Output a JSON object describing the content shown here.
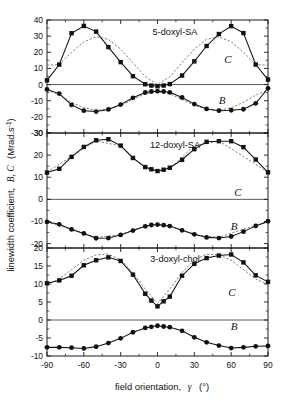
{
  "figure": {
    "y_axis_title_main": "linewidth coefficient,",
    "y_axis_title_symbols": "B, C",
    "y_axis_title_units": "(Mrad.s",
    "y_axis_title_units_sup": "-1",
    "y_axis_title_units_close": ")",
    "x_axis_title_main": "field orientation,",
    "x_axis_title_symbol": "γ",
    "x_axis_title_units": "(°)",
    "x_ticks": [
      "-90",
      "-60",
      "-30",
      "0",
      "30",
      "60",
      "90"
    ],
    "x_tick_values": [
      -90,
      -60,
      -30,
      0,
      30,
      60,
      90
    ],
    "xlim": [
      -90,
      90
    ],
    "colors": {
      "data": "#111111",
      "fit": "#777777",
      "frame": "#1a1a1a",
      "zeroline": "#5a5a5a",
      "background": "#ffffff"
    },
    "curve_label_C": "C",
    "curve_label_B": "B"
  },
  "chart_data": [
    {
      "type": "line",
      "panel": 1,
      "title": "5-doxyl-SA",
      "xlabel": "",
      "ylabel": "linewidth coefficient, B, C (Mrad.s-1)",
      "ylim": [
        -30,
        40
      ],
      "yticks": [
        40,
        30,
        20,
        10,
        0,
        -10,
        -20,
        -30
      ],
      "ytick_labels": [
        "40",
        "30",
        "20",
        "10",
        "0",
        "-10",
        "-20",
        "-30"
      ],
      "grid": false,
      "legend": "inline-annotation",
      "x": [
        -90,
        -80,
        -70,
        -60,
        -50,
        -40,
        -30,
        -20,
        -10,
        -5,
        0,
        5,
        10,
        20,
        30,
        40,
        50,
        60,
        70,
        80,
        90
      ],
      "series": [
        {
          "name": "C",
          "marker": "square",
          "values": [
            2.6,
            12.4,
            31.8,
            36.3,
            32.8,
            23.2,
            13.9,
            5.2,
            0.2,
            -0.6,
            -1.0,
            -0.6,
            0.3,
            5.6,
            14.4,
            23.9,
            31.3,
            36.2,
            31.9,
            12.4,
            3.1
          ]
        },
        {
          "name": "B",
          "marker": "circle",
          "values": [
            -3.0,
            -5.6,
            -12.6,
            -16.2,
            -16.7,
            -15.4,
            -12.4,
            -8.2,
            -4.9,
            -4.3,
            -4.1,
            -4.3,
            -4.8,
            -8.0,
            -12.1,
            -15.1,
            -16.2,
            -15.9,
            -15.3,
            -11.6,
            -2.3
          ]
        }
      ],
      "fits": [
        {
          "name": "C-fit",
          "style": "dashed",
          "x": [
            -90,
            -80,
            -70,
            -60,
            -50,
            -40,
            -30,
            -20,
            -10,
            0,
            10,
            20,
            30,
            40,
            50,
            60,
            70,
            80,
            90
          ],
          "values": [
            12.0,
            12.4,
            20.0,
            26.5,
            29.6,
            28.0,
            22.0,
            13.5,
            5.0,
            0.0,
            5.0,
            13.5,
            22.0,
            28.0,
            29.6,
            26.5,
            20.0,
            12.4,
            12.0
          ]
        },
        {
          "name": "B-fit",
          "style": "dashed",
          "x": [
            -90,
            -80,
            -70,
            -60,
            -50,
            -40,
            -30,
            -20,
            -10,
            0,
            10,
            20,
            30,
            40,
            50,
            60,
            70,
            80,
            90
          ],
          "values": [
            -3.4,
            -6.5,
            -11.0,
            -14.4,
            -15.9,
            -15.3,
            -12.9,
            -9.2,
            -5.8,
            -4.5,
            -5.8,
            -9.2,
            -12.9,
            -15.3,
            -15.9,
            -14.4,
            -11.0,
            -6.5,
            -3.4
          ]
        }
      ]
    },
    {
      "type": "line",
      "panel": 2,
      "title": "12-doxyl-SA",
      "xlabel": "",
      "ylabel": "",
      "ylim": [
        -22,
        30
      ],
      "yticks": [
        30,
        20,
        10,
        0,
        -10,
        -20
      ],
      "ytick_labels": [
        "30",
        "20",
        "10",
        "0",
        "-10",
        "-20"
      ],
      "grid": false,
      "legend": "inline-annotation",
      "x": [
        -90,
        -80,
        -70,
        -60,
        -50,
        -40,
        -30,
        -20,
        -10,
        -5,
        0,
        5,
        10,
        20,
        30,
        40,
        50,
        60,
        70,
        80,
        90
      ],
      "series": [
        {
          "name": "C",
          "marker": "square",
          "values": [
            12.1,
            13.8,
            19.2,
            23.7,
            26.7,
            27.2,
            24.3,
            18.7,
            14.6,
            13.6,
            12.8,
            13.4,
            14.3,
            17.9,
            22.7,
            26.0,
            26.3,
            26.3,
            23.6,
            18.0,
            12.2
          ]
        },
        {
          "name": "B",
          "marker": "circle",
          "values": [
            -10.2,
            -11.3,
            -13.6,
            -15.4,
            -17.6,
            -17.5,
            -16.1,
            -14.1,
            -12.2,
            -11.6,
            -11.4,
            -11.7,
            -12.1,
            -14.0,
            -15.8,
            -17.2,
            -17.5,
            -16.8,
            -14.6,
            -12.0,
            -9.9
          ]
        }
      ],
      "fits": [
        {
          "name": "C-fit",
          "style": "dashed",
          "x": [
            -90,
            -70,
            -50,
            -30,
            -10,
            0,
            10,
            30,
            50,
            70,
            90
          ],
          "values": [
            12.3,
            19.4,
            26.4,
            24.2,
            13.9,
            12.9,
            13.9,
            24.2,
            26.4,
            19.4,
            12.3
          ]
        },
        {
          "name": "B-fit",
          "style": "dashed",
          "x": [
            -90,
            -70,
            -50,
            -30,
            -10,
            0,
            10,
            30,
            50,
            70,
            90
          ],
          "values": [
            -10.3,
            -13.5,
            -17.2,
            -16.0,
            -12.0,
            -11.5,
            -12.0,
            -16.0,
            -17.2,
            -13.5,
            -10.3
          ]
        }
      ]
    },
    {
      "type": "line",
      "panel": 3,
      "title": "3-doxyl-chol",
      "xlabel": "field orientation, γ (°)",
      "ylabel": "",
      "ylim": [
        -10,
        20
      ],
      "yticks": [
        20,
        15,
        10,
        5,
        0,
        -5,
        -10
      ],
      "ytick_labels": [
        "20",
        "15",
        "10",
        "5",
        "0",
        "-5",
        "-10"
      ],
      "grid": false,
      "legend": "inline-annotation",
      "x": [
        -90,
        -80,
        -70,
        -60,
        -50,
        -40,
        -30,
        -20,
        -10,
        -5,
        0,
        5,
        10,
        20,
        30,
        40,
        50,
        60,
        70,
        80,
        90
      ],
      "series": [
        {
          "name": "C",
          "marker": "square",
          "values": [
            10.2,
            11.0,
            12.3,
            15.2,
            16.6,
            17.4,
            16.4,
            12.6,
            7.3,
            5.4,
            3.8,
            5.2,
            6.5,
            12.3,
            15.6,
            17.2,
            17.9,
            18.2,
            16.0,
            12.4,
            10.6
          ]
        },
        {
          "name": "B",
          "marker": "circle",
          "values": [
            -7.6,
            -7.6,
            -7.7,
            -7.9,
            -7.4,
            -6.4,
            -5.1,
            -3.4,
            -2.2,
            -1.9,
            -1.6,
            -1.8,
            -2.0,
            -3.0,
            -4.8,
            -6.2,
            -7.1,
            -7.8,
            -7.6,
            -7.3,
            -7.2
          ]
        }
      ],
      "fits": [
        {
          "name": "C-fit",
          "style": "dashed",
          "x": [
            -90,
            -80,
            -70,
            -60,
            -50,
            -40,
            -30,
            -20,
            -10,
            0,
            10,
            20,
            30,
            40,
            50,
            60,
            70,
            80,
            90
          ],
          "values": [
            9.8,
            11.4,
            14.0,
            16.6,
            18.1,
            18.3,
            16.7,
            13.2,
            8.6,
            4.6,
            8.6,
            13.2,
            16.7,
            18.3,
            18.1,
            16.6,
            14.0,
            11.4,
            9.8
          ]
        }
      ]
    }
  ]
}
